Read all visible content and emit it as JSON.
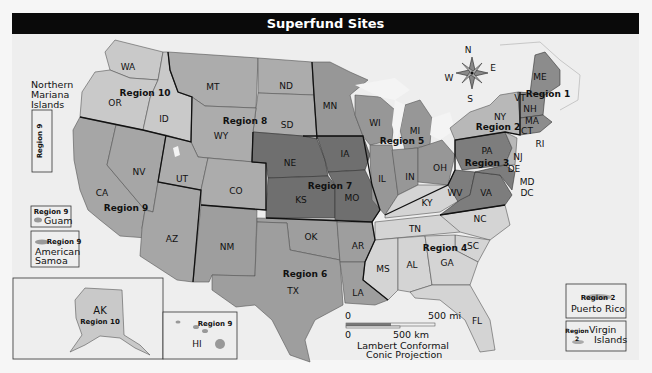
{
  "title": "Superfund Sites",
  "colors": {
    "background": "#eeeeee",
    "title_bar": "#0a0a0a",
    "region_1": "#8c8c8c",
    "region_2": "#b8b8b8",
    "region_3": "#7d7d7d",
    "region_4": "#d4d4d4",
    "region_5": "#979797",
    "region_6": "#9e9e9e",
    "region_7": "#6f6f6f",
    "region_8": "#acacac",
    "region_9": "#a6a6a6",
    "region_10": "#c9c9c9",
    "water": "#f4f4f4"
  },
  "regions": [
    {
      "name": "Region 1",
      "states": [
        "ME",
        "VT",
        "NH",
        "MA",
        "CT",
        "RI"
      ]
    },
    {
      "name": "Region 2",
      "states": [
        "NY",
        "NJ"
      ],
      "territories": [
        "Puerto Rico",
        "Virgin Islands"
      ]
    },
    {
      "name": "Region 3",
      "states": [
        "PA",
        "DE",
        "MD",
        "DC",
        "VA",
        "WV"
      ]
    },
    {
      "name": "Region 4",
      "states": [
        "KY",
        "TN",
        "NC",
        "SC",
        "MS",
        "AL",
        "GA",
        "FL"
      ]
    },
    {
      "name": "Region 5",
      "states": [
        "MN",
        "WI",
        "MI",
        "IL",
        "IN",
        "OH"
      ]
    },
    {
      "name": "Region 6",
      "states": [
        "NM",
        "OK",
        "AR",
        "TX",
        "LA"
      ]
    },
    {
      "name": "Region 7",
      "states": [
        "NE",
        "IA",
        "KS",
        "MO"
      ]
    },
    {
      "name": "Region 8",
      "states": [
        "MT",
        "ND",
        "SD",
        "WY",
        "UT",
        "CO"
      ]
    },
    {
      "name": "Region 9",
      "states": [
        "CA",
        "NV",
        "AZ",
        "HI"
      ],
      "territories": [
        "Northern Mariana Islands",
        "Guam",
        "American Samoa"
      ]
    },
    {
      "name": "Region 10",
      "states": [
        "WA",
        "OR",
        "ID",
        "AK"
      ]
    }
  ],
  "labels": {
    "region_1": "Region 1",
    "region_2": "Region 2",
    "region_3": "Region 3",
    "region_4": "Region 4",
    "region_5": "Region 5",
    "region_6": "Region 6",
    "region_7": "Region 7",
    "region_8": "Region 8",
    "region_9": "Region 9",
    "region_10": "Region 10"
  },
  "states": {
    "WA": "WA",
    "OR": "OR",
    "ID": "ID",
    "CA": "CA",
    "NV": "NV",
    "AZ": "AZ",
    "UT": "UT",
    "MT": "MT",
    "WY": "WY",
    "CO": "CO",
    "ND": "ND",
    "SD": "SD",
    "NM": "NM",
    "NE": "NE",
    "KS": "KS",
    "IA": "IA",
    "MO": "MO",
    "OK": "OK",
    "TX": "TX",
    "AR": "AR",
    "LA": "LA",
    "MN": "MN",
    "WI": "WI",
    "MI": "MI",
    "IL": "IL",
    "IN": "IN",
    "OH": "OH",
    "KY": "KY",
    "TN": "TN",
    "NC": "NC",
    "SC": "SC",
    "MS": "MS",
    "AL": "AL",
    "GA": "GA",
    "FL": "FL",
    "PA": "PA",
    "WV": "WV",
    "VA": "VA",
    "DE": "DE",
    "MD": "MD",
    "DC": "DC",
    "NJ": "NJ",
    "NY": "NY",
    "ME": "ME",
    "VT": "VT",
    "NH": "NH",
    "MA": "MA",
    "CT": "CT",
    "RI": "RI",
    "AK": "AK",
    "HI": "HI"
  },
  "insets": {
    "northern_mariana": {
      "name": "Northern\nMariana\nIslands",
      "line1": "Northern",
      "line2": "Mariana",
      "line3": "Islands",
      "region": "Region 9"
    },
    "guam": {
      "name": "Guam",
      "region": "Region 9"
    },
    "american_samoa": {
      "line1": "American",
      "line2": "Samoa",
      "region": "Region 9"
    },
    "alaska": {
      "state": "AK",
      "region": "Region 10"
    },
    "hawaii": {
      "state": "HI",
      "region": "Region 9"
    },
    "puerto_rico": {
      "name": "Puerto Rico",
      "region": "Region 2"
    },
    "virgin_islands": {
      "line1": "Virgin",
      "line2": "Islands",
      "region_word": "Region",
      "region_num": "2"
    }
  },
  "compass": {
    "n": "N",
    "e": "E",
    "s": "S",
    "w": "W"
  },
  "scale": {
    "mi_zero": "0",
    "mi_label": "500 mi",
    "km_zero": "0",
    "km_label": "500 km",
    "projection_line1": "Lambert Conformal",
    "projection_line2": "Conic Projection"
  }
}
